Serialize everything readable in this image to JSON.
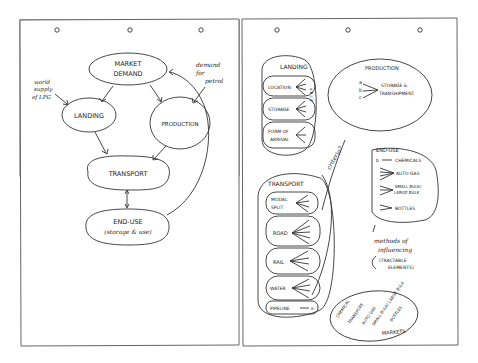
{
  "left_page": {
    "nodes": {
      "market_demand": [
        "MARKET",
        "DEMAND"
      ],
      "landing": "LANDING",
      "production": "PRODUCTION",
      "transport": "TRANSPORT",
      "end_use": [
        "END-USE",
        "(storage & use)"
      ]
    },
    "annotations": {
      "world_supply": [
        "world",
        "supply",
        "of LPG"
      ],
      "demand_petrol": [
        "demand",
        "for",
        "petrol"
      ]
    }
  },
  "right_page": {
    "landing": {
      "title": "LANDING",
      "items": [
        {
          "label": [
            "LOCATION"
          ],
          "letters": "a b c d"
        },
        {
          "label": [
            "STORAGE"
          ],
          "letters": "a b c d"
        },
        {
          "label": [
            "FORM OF",
            "ARRIVAL"
          ],
          "letters": "a b c"
        }
      ]
    },
    "production": {
      "title": "PRODUCTION",
      "letters": [
        "a",
        "b",
        "c"
      ],
      "target": [
        "STORAGE &",
        "TRANSHIPMENT"
      ]
    },
    "transport": {
      "title": "TRANSPORT",
      "items": [
        {
          "label": [
            "MODAL",
            "SPLIT"
          ],
          "letters": "1 2 3 4"
        },
        {
          "label": [
            "ROAD"
          ],
          "letters": "b c d e f"
        },
        {
          "label": [
            "RAIL"
          ],
          "letters": "b d e f"
        },
        {
          "label": [
            "WATER"
          ],
          "letters": "b d e f"
        },
        {
          "label": [
            "PIPELINE"
          ],
          "letters": "e"
        }
      ]
    },
    "criteria": "criteria?",
    "end_use": {
      "title": "END-USE",
      "items": [
        {
          "letters": "b",
          "label": [
            "CHEMICALS"
          ]
        },
        {
          "letters": "a b c d",
          "label": [
            "AUTO GAS"
          ]
        },
        {
          "letters": "a b d",
          "label": [
            "SMALL BULK/",
            "LARGE BULK"
          ]
        },
        {
          "letters": "a b",
          "label": [
            "BOTTLES"
          ]
        }
      ]
    },
    "methods": [
      "methods of",
      "influencing"
    ],
    "tractable": [
      "(TRACTABLE",
      "ELEMENTS)"
    ],
    "markets": {
      "items": [
        "CHEMICAL",
        "TRANSPORT",
        "AUTO GAS",
        "SMALL BULK/ LARGE BULK",
        "BOTTLES"
      ],
      "title": "MARKETS"
    }
  }
}
